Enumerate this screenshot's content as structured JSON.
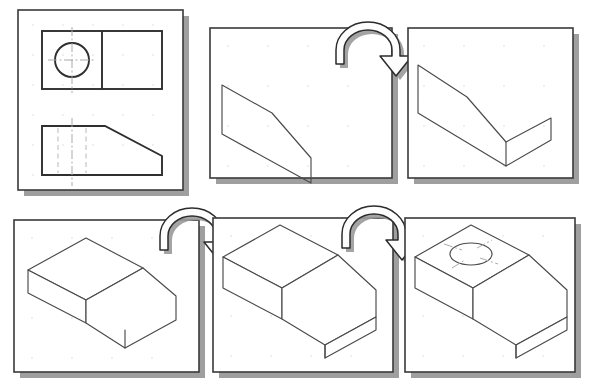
{
  "figure": {
    "background_color": "#ffffff",
    "panel_border_color": "#3a3a3a",
    "panel_shadow_color": "#8e8e8e",
    "line_color": "#4a4a4a",
    "hidden_line_color": "#b9b9b9",
    "centerline_color": "#aaaaaa",
    "grid_dot_color": "#cfcfcf",
    "panel_count": 6,
    "arrow_count": 3,
    "rows": 2,
    "columns": 3
  },
  "panels": [
    {
      "id": "panel-1",
      "index": 1,
      "name": "orthographic-views",
      "caption": "Orthographic views: top view with circle and front view with chamfer",
      "x": 18,
      "y": 10,
      "width": 165,
      "height": 180,
      "views": [
        {
          "name": "top-view",
          "caption": "Top view: rectangle divided by vertical line with centered circle and crosshair centerlines",
          "features": [
            "rectangle",
            "vertical-divider",
            "circle",
            "horizontal-centerline",
            "vertical-centerline"
          ]
        },
        {
          "name": "front-view",
          "caption": "Front view: rectangle with chamfered upper-right corner and dashed hidden lines",
          "features": [
            "rectangle",
            "chamfer",
            "hidden-line-left",
            "hidden-line-center",
            "hidden-line-right",
            "vertical-centerline"
          ]
        }
      ]
    },
    {
      "id": "panel-2",
      "index": 2,
      "name": "profile-sketch",
      "caption": "Isometric profile sketch of the chamfered side face",
      "x": 210,
      "y": 28,
      "width": 182,
      "height": 150,
      "features": [
        "profile-outline",
        "chamfer-edge"
      ]
    },
    {
      "id": "panel-3",
      "index": 3,
      "name": "profile-with-base-flange",
      "caption": "Profile sketch with base flange added along the bottom edge",
      "x": 408,
      "y": 28,
      "width": 165,
      "height": 150,
      "features": [
        "profile-outline",
        "chamfer-edge",
        "base-flange"
      ]
    },
    {
      "id": "panel-4",
      "index": 4,
      "name": "partial-extrusion",
      "caption": "Profile extruded into a partial solid showing the sloping face",
      "x": 14,
      "y": 220,
      "width": 185,
      "height": 152,
      "features": [
        "extruded-surface",
        "sloped-face",
        "side-wall",
        "base-edge"
      ]
    },
    {
      "id": "panel-5",
      "index": 5,
      "name": "completed-solid",
      "caption": "Completed solid block with top face, chamfered slope and base plinth",
      "x": 213,
      "y": 218,
      "width": 180,
      "height": 154,
      "features": [
        "top-face",
        "sloped-face",
        "front-face",
        "side-face",
        "base-plinth"
      ]
    },
    {
      "id": "panel-6",
      "index": 6,
      "name": "solid-with-hole",
      "caption": "Final solid with circular hole cut in the top face, shown with centerline cross",
      "x": 405,
      "y": 218,
      "width": 170,
      "height": 154,
      "features": [
        "top-face",
        "sloped-face",
        "front-face",
        "side-face",
        "base-plinth",
        "circular-hole",
        "hole-centerlines"
      ]
    }
  ],
  "arrows": [
    {
      "id": "arrow-1",
      "name": "transition-arrow-panel1-to-panel2",
      "caption": "Curved 3D arrow pointing from the profile sketch toward the flanged profile",
      "from_panel": "panel-2",
      "to_panel": "panel-3",
      "cx": 372,
      "cy": 42,
      "style": "curved-u-turn-right"
    },
    {
      "id": "arrow-2",
      "name": "transition-arrow-panel4-to-panel5",
      "caption": "Curved 3D arrow pointing from the partial extrusion toward the completed solid",
      "from_panel": "panel-4",
      "to_panel": "panel-5",
      "cx": 196,
      "cy": 228,
      "style": "curved-u-turn-right"
    },
    {
      "id": "arrow-3",
      "name": "transition-arrow-panel5-to-panel6",
      "caption": "Curved 3D arrow pointing from the completed solid toward the solid with hole",
      "from_panel": "panel-5",
      "to_panel": "panel-6",
      "cx": 378,
      "cy": 226,
      "style": "curved-u-turn-right"
    }
  ]
}
